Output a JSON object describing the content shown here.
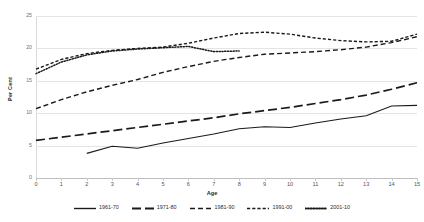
{
  "chart": {
    "type": "line",
    "title": "",
    "xlabel": "Age",
    "ylabel": "Per Cent",
    "xlim": [
      0,
      15
    ],
    "ylim": [
      0,
      25
    ],
    "yticks": [
      "0",
      "5",
      "10",
      "15",
      "20",
      "25"
    ],
    "xticks": [
      "0",
      "1",
      "2",
      "3",
      "4",
      "5",
      "6",
      "7",
      "8",
      "9",
      "10",
      "11",
      "12",
      "13",
      "14",
      "15"
    ],
    "grid": "horizontal",
    "legend_position": "bottom"
  },
  "chart_data": {
    "type": "line",
    "title": "",
    "xlabel": "Age",
    "ylabel": "Per Cent",
    "xlim": [
      0,
      15
    ],
    "ylim": [
      0,
      25
    ],
    "x": [
      0,
      1,
      2,
      3,
      4,
      5,
      6,
      7,
      8,
      9,
      10,
      11,
      12,
      13,
      14,
      15
    ],
    "series": [
      {
        "name": "1961-70",
        "style": "solid",
        "color": "#1a1a1a",
        "x": [
          2,
          3,
          4,
          5,
          6,
          7,
          8,
          9,
          10,
          11,
          12,
          13,
          14,
          15
        ],
        "values": [
          3.8,
          4.9,
          4.6,
          5.4,
          6.1,
          6.8,
          7.6,
          7.9,
          7.8,
          8.5,
          9.1,
          9.6,
          11.1,
          11.2
        ]
      },
      {
        "name": "1971-80",
        "style": "long-dash",
        "color": "#1a1a1a",
        "x": [
          0,
          1,
          2,
          3,
          4,
          5,
          6,
          7,
          8,
          9,
          10,
          11,
          12,
          13,
          14,
          15
        ],
        "values": [
          5.8,
          6.3,
          6.8,
          7.3,
          7.8,
          8.3,
          8.8,
          9.3,
          9.9,
          10.4,
          10.9,
          11.5,
          12.1,
          12.8,
          13.7,
          14.7
        ]
      },
      {
        "name": "1981-90",
        "style": "medium-dash",
        "color": "#1a1a1a",
        "x": [
          0,
          1,
          2,
          3,
          4,
          5,
          6,
          7,
          8,
          9,
          10,
          11,
          12,
          13,
          14,
          15
        ],
        "values": [
          10.7,
          12.1,
          13.3,
          14.3,
          15.2,
          16.3,
          17.2,
          18.0,
          18.6,
          19.1,
          19.3,
          19.5,
          19.8,
          20.2,
          20.9,
          21.8
        ]
      },
      {
        "name": "1991-00",
        "style": "short-dash",
        "color": "#1a1a1a",
        "x": [
          0,
          1,
          2,
          3,
          4,
          5,
          6,
          7,
          8,
          9,
          10,
          11,
          12,
          13,
          14,
          15
        ],
        "values": [
          16.8,
          18.3,
          19.2,
          19.7,
          20.0,
          20.2,
          20.8,
          21.6,
          22.3,
          22.5,
          22.2,
          21.6,
          21.2,
          21.0,
          21.1,
          22.2
        ]
      },
      {
        "name": "2001-10",
        "style": "dotted",
        "color": "#1a1a1a",
        "x": [
          0,
          1,
          2,
          3,
          4,
          5,
          6,
          7,
          8
        ],
        "values": [
          16.1,
          17.9,
          19.0,
          19.6,
          19.9,
          20.1,
          20.3,
          19.5,
          19.6
        ]
      }
    ],
    "legend": [
      "1961-70",
      "1971-80",
      "1981-90",
      "1991-00",
      "2001-10"
    ]
  }
}
